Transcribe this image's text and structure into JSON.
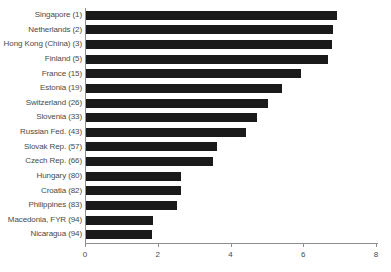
{
  "chart_data": {
    "type": "bar",
    "orientation": "horizontal",
    "title": "",
    "subtitle": "",
    "xlabel": "",
    "ylabel": "",
    "xlim": [
      0,
      8
    ],
    "grid": false,
    "legend": null,
    "bar_color": "#1a1a1a",
    "axis_color": "#8d8d8d",
    "label_color": "#4a4a4a",
    "xticks": [
      0,
      2,
      4,
      6,
      8
    ],
    "xtick_labels": [
      "0",
      "2",
      "4",
      "6",
      "8"
    ],
    "categories": [
      "Singapore (1)",
      "Netherlands (2)",
      "Hong Kong (China) (3)",
      "Finland (5)",
      "France (15)",
      "Estonia (19)",
      "Switzerland (26)",
      "Slovenia (33)",
      "Russian Fed. (43)",
      "Slovak Rep. (57)",
      "Czech Rep. (66)",
      "Hungary (80)",
      "Croatia (82)",
      "Philippines (83)",
      "Macedonia, FYR (94)",
      "Nicaragua (94)"
    ],
    "values": [
      6.9,
      6.8,
      6.75,
      6.65,
      5.9,
      5.4,
      5.0,
      4.7,
      4.4,
      3.6,
      3.5,
      2.6,
      2.6,
      2.5,
      1.85,
      1.8
    ]
  }
}
